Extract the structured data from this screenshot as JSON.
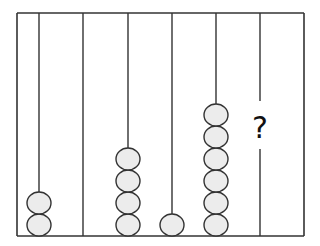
{
  "diagram": {
    "type": "abacus",
    "frame": {
      "left": 17,
      "top": 13,
      "right": 304,
      "bottom": 236
    },
    "colors": {
      "line": "#333333",
      "bead_fill": "#ececec",
      "bead_stroke": "#333333",
      "question": "#111111"
    },
    "bead": {
      "rx": 12,
      "ry": 11
    },
    "rods": [
      {
        "x": 39,
        "beads": 2,
        "label": ""
      },
      {
        "x": 83,
        "beads": 0,
        "label": ""
      },
      {
        "x": 128,
        "beads": 4,
        "label": ""
      },
      {
        "x": 172,
        "beads": 1,
        "label": ""
      },
      {
        "x": 216,
        "beads": 6,
        "label": ""
      },
      {
        "x": 260,
        "beads": null,
        "label": "?"
      }
    ],
    "question_mark": "?"
  }
}
